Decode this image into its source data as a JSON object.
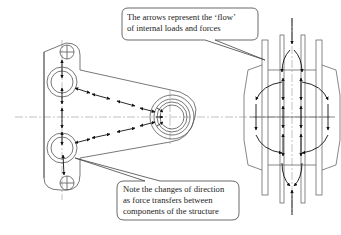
{
  "callouts": {
    "top": {
      "line1": "The arrows represent the ‘flow’",
      "line2": "of internal loads and forces"
    },
    "bottom": {
      "line1": "Note the changes of direction",
      "line2": "as force transfers between",
      "line3": "components of the structure"
    }
  },
  "colors": {
    "line": "#555555",
    "arrow": "#111111",
    "centerline": "#888888"
  }
}
